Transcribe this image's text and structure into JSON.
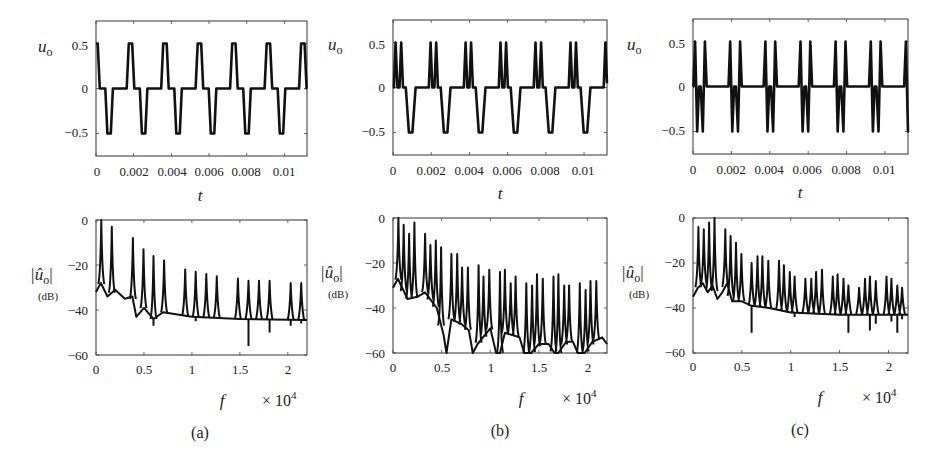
{
  "figure": {
    "panels": [
      {
        "id": "a",
        "caption": "(a)",
        "time_plot": {
          "ylabel": "u",
          "ylabel_sub": "o",
          "xlabel": "t",
          "xticks": [
            "0",
            "0.002",
            "0.004",
            "0.006",
            "0.008",
            "0.01"
          ],
          "yticks": [
            "0.5",
            "0",
            "−0.5"
          ]
        },
        "spectrum_plot": {
          "ylabel": "|û",
          "ylabel_sub": "o",
          "ylabel_close": "|",
          "ylabel_unit": "(dB)",
          "xlabel": "f",
          "xmult": "× 10",
          "xmult_exp": "4",
          "xticks": [
            "0",
            "0.5",
            "1",
            "1.5",
            "2"
          ],
          "yticks": [
            "0",
            "−20",
            "−40",
            "−60"
          ]
        }
      },
      {
        "id": "b",
        "caption": "(b)",
        "time_plot": {
          "ylabel": "u",
          "ylabel_sub": "o",
          "xlabel": "t",
          "xticks": [
            "0",
            "0.002",
            "0.004",
            "0.006",
            "0.008",
            "0.01"
          ],
          "yticks": [
            "0.5",
            "0",
            "−0.5"
          ]
        },
        "spectrum_plot": {
          "ylabel": "|û",
          "ylabel_sub": "o",
          "ylabel_close": "|",
          "ylabel_unit": "(dB)",
          "xlabel": "f",
          "xmult": "× 10",
          "xmult_exp": "4",
          "xticks": [
            "0",
            "0.5",
            "1",
            "1.5",
            "2"
          ],
          "yticks": [
            "0",
            "−20",
            "−40",
            "−60"
          ]
        }
      },
      {
        "id": "c",
        "caption": "(c)",
        "time_plot": {
          "ylabel": "u",
          "ylabel_sub": "o",
          "xlabel": "t",
          "xticks": [
            "0",
            "0.002",
            "0.004",
            "0.006",
            "0.008",
            "0.01"
          ],
          "yticks": [
            "0.5",
            "0",
            "−0.5"
          ]
        },
        "spectrum_plot": {
          "ylabel": "|û",
          "ylabel_sub": "o",
          "ylabel_close": "|",
          "ylabel_unit": "(dB)",
          "xlabel": "f",
          "xmult": "× 10",
          "xmult_exp": "4",
          "xticks": [
            "0",
            "0.5",
            "1",
            "1.5",
            "2"
          ],
          "yticks": [
            "0",
            "−20",
            "−40",
            "−60"
          ]
        }
      }
    ]
  },
  "chart_data": [
    {
      "panel": "a-top",
      "type": "line",
      "title": "",
      "xlabel": "t",
      "ylabel": "u_o",
      "xlim": [
        0,
        0.0112
      ],
      "ylim": [
        -0.75,
        0.75
      ],
      "xticks": [
        0,
        0.002,
        0.004,
        0.006,
        0.008,
        0.01
      ],
      "yticks": [
        0.5,
        0,
        -0.5
      ],
      "grid": false,
      "description": "Periodic multilevel waveform: one trapezoidal positive pulse (+0.5) and one negative pulse (-0.5) per period, period approx 0.00183 s, zero-level dwell between pulses",
      "period": 0.00183,
      "pattern": [
        {
          "t": 0.0,
          "v": 0
        },
        {
          "t": 0.06,
          "v": 0
        },
        {
          "t": 0.12,
          "v": 0.5
        },
        {
          "t": 0.22,
          "v": 0.5
        },
        {
          "t": 0.28,
          "v": 0
        },
        {
          "t": 0.44,
          "v": 0
        },
        {
          "t": 0.5,
          "v": -0.5
        },
        {
          "t": 0.6,
          "v": -0.5
        },
        {
          "t": 0.66,
          "v": 0
        },
        {
          "t": 1.0,
          "v": 0
        }
      ],
      "phase": -0.17
    },
    {
      "panel": "b-top",
      "type": "line",
      "title": "",
      "xlabel": "t",
      "ylabel": "u_o",
      "xlim": [
        0,
        0.0112
      ],
      "ylim": [
        -0.75,
        0.75
      ],
      "xticks": [
        0,
        0.002,
        0.004,
        0.006,
        0.008,
        0.01
      ],
      "yticks": [
        0.5,
        0,
        -0.5
      ],
      "grid": false,
      "description": "Periodic waveform: two narrow positive triangular pulses (+0.5) followed by one negative trapezoidal pulse (-0.5) per period, period approx 0.00183 s",
      "period": 0.00183,
      "pattern": [
        {
          "t": 0.0,
          "v": 0
        },
        {
          "t": 0.04,
          "v": 0
        },
        {
          "t": 0.09,
          "v": 0.5
        },
        {
          "t": 0.14,
          "v": 0
        },
        {
          "t": 0.2,
          "v": 0
        },
        {
          "t": 0.25,
          "v": 0.5
        },
        {
          "t": 0.3,
          "v": 0
        },
        {
          "t": 0.38,
          "v": 0
        },
        {
          "t": 0.47,
          "v": -0.5
        },
        {
          "t": 0.57,
          "v": -0.5
        },
        {
          "t": 0.66,
          "v": 0
        },
        {
          "t": 1.0,
          "v": 0
        }
      ],
      "phase": -0.015
    },
    {
      "panel": "c-top",
      "type": "line",
      "title": "",
      "xlabel": "t",
      "ylabel": "u_o",
      "xlim": [
        0,
        0.0112
      ],
      "ylim": [
        -0.75,
        0.75
      ],
      "xticks": [
        0,
        0.002,
        0.004,
        0.006,
        0.008,
        0.01
      ],
      "yticks": [
        0.5,
        0,
        -0.5
      ],
      "grid": false,
      "description": "Periodic waveform: two narrow positive triangular pulses (+0.5) and two narrow negative triangular pulses (-0.5) per period, period approx 0.00183 s",
      "period": 0.00183,
      "pattern": [
        {
          "t": 0.0,
          "v": 0
        },
        {
          "t": 0.04,
          "v": 0
        },
        {
          "t": 0.09,
          "v": 0.5
        },
        {
          "t": 0.15,
          "v": -0.5
        },
        {
          "t": 0.2,
          "v": 0
        },
        {
          "t": 0.25,
          "v": 0
        },
        {
          "t": 0.31,
          "v": -0.5
        },
        {
          "t": 0.37,
          "v": 0.5
        },
        {
          "t": 0.42,
          "v": 0
        },
        {
          "t": 1.0,
          "v": 0
        }
      ],
      "phase": -0.03
    },
    {
      "panel": "a-bottom",
      "type": "line",
      "title": "",
      "xlabel": "f (× 10^4)",
      "ylabel": "|û_o| (dB)",
      "xlim": [
        0,
        2.2
      ],
      "ylim": [
        -60,
        0
      ],
      "xticks": [
        0,
        0.5,
        1,
        1.5,
        2
      ],
      "yticks": [
        0,
        -20,
        -40,
        -60
      ],
      "grid": false,
      "floor": [
        {
          "f": 0.0,
          "db": -32
        },
        {
          "f": 0.05,
          "db": -28
        },
        {
          "f": 0.12,
          "db": -34
        },
        {
          "f": 0.2,
          "db": -31
        },
        {
          "f": 0.3,
          "db": -35
        },
        {
          "f": 0.38,
          "db": -34
        },
        {
          "f": 0.42,
          "db": -43
        },
        {
          "f": 0.5,
          "db": -39
        },
        {
          "f": 0.6,
          "db": -44
        },
        {
          "f": 0.7,
          "db": -41
        },
        {
          "f": 1.0,
          "db": -43
        },
        {
          "f": 1.5,
          "db": -44
        },
        {
          "f": 2.2,
          "db": -44.5
        }
      ],
      "peaks": [
        {
          "f": 0.055,
          "db": 0
        },
        {
          "f": 0.165,
          "db": -3
        },
        {
          "f": 0.385,
          "db": -8
        },
        {
          "f": 0.495,
          "db": -13
        },
        {
          "f": 0.6,
          "db": -16
        },
        {
          "f": 0.71,
          "db": -18
        },
        {
          "f": 0.93,
          "db": -22
        },
        {
          "f": 1.04,
          "db": -23
        },
        {
          "f": 1.15,
          "db": -24
        },
        {
          "f": 1.26,
          "db": -25
        },
        {
          "f": 1.48,
          "db": -26
        },
        {
          "f": 1.59,
          "db": -27
        },
        {
          "f": 1.7,
          "db": -27
        },
        {
          "f": 1.81,
          "db": -27
        },
        {
          "f": 2.03,
          "db": -28
        },
        {
          "f": 2.14,
          "db": -28
        }
      ],
      "dips": [
        {
          "f": 0.6,
          "db": -47
        },
        {
          "f": 1.04,
          "db": -45
        },
        {
          "f": 1.59,
          "db": -56
        },
        {
          "f": 1.81,
          "db": -50
        },
        {
          "f": 2.03,
          "db": -47
        },
        {
          "f": 2.14,
          "db": -46
        }
      ]
    },
    {
      "panel": "b-bottom",
      "type": "line",
      "title": "",
      "xlabel": "f (× 10^4)",
      "ylabel": "|û_o| (dB)",
      "xlim": [
        0,
        2.2
      ],
      "ylim": [
        -60,
        0
      ],
      "xticks": [
        0,
        0.5,
        1,
        1.5,
        2
      ],
      "yticks": [
        0,
        -20,
        -40,
        -60
      ],
      "grid": false,
      "floor": [
        {
          "f": 0.0,
          "db": -31
        },
        {
          "f": 0.05,
          "db": -27
        },
        {
          "f": 0.15,
          "db": -36
        },
        {
          "f": 0.25,
          "db": -35
        },
        {
          "f": 0.33,
          "db": -33
        },
        {
          "f": 0.45,
          "db": -40
        },
        {
          "f": 0.52,
          "db": -52
        },
        {
          "f": 0.55,
          "db": -60
        },
        {
          "f": 0.6,
          "db": -45
        },
        {
          "f": 0.7,
          "db": -47
        },
        {
          "f": 0.78,
          "db": -50
        },
        {
          "f": 0.82,
          "db": -60
        },
        {
          "f": 0.87,
          "db": -56
        },
        {
          "f": 1.0,
          "db": -49
        },
        {
          "f": 1.06,
          "db": -60
        },
        {
          "f": 1.1,
          "db": -60
        },
        {
          "f": 1.15,
          "db": -51
        },
        {
          "f": 1.3,
          "db": -53
        },
        {
          "f": 1.35,
          "db": -60
        },
        {
          "f": 1.42,
          "db": -60
        },
        {
          "f": 1.5,
          "db": -56
        },
        {
          "f": 1.6,
          "db": -56
        },
        {
          "f": 1.66,
          "db": -60
        },
        {
          "f": 1.7,
          "db": -60
        },
        {
          "f": 1.78,
          "db": -55
        },
        {
          "f": 1.85,
          "db": -55
        },
        {
          "f": 1.9,
          "db": -60
        },
        {
          "f": 1.97,
          "db": -60
        },
        {
          "f": 2.05,
          "db": -55
        },
        {
          "f": 2.15,
          "db": -53
        },
        {
          "f": 2.2,
          "db": -56
        }
      ],
      "peaks": [
        {
          "f": 0.055,
          "db": 0
        },
        {
          "f": 0.11,
          "db": -3
        },
        {
          "f": 0.165,
          "db": -7
        },
        {
          "f": 0.22,
          "db": -2
        },
        {
          "f": 0.33,
          "db": -7
        },
        {
          "f": 0.385,
          "db": -12
        },
        {
          "f": 0.44,
          "db": -10
        },
        {
          "f": 0.495,
          "db": -13
        },
        {
          "f": 0.6,
          "db": -16
        },
        {
          "f": 0.66,
          "db": -16
        },
        {
          "f": 0.71,
          "db": -22
        },
        {
          "f": 0.77,
          "db": -22
        },
        {
          "f": 0.88,
          "db": -21
        },
        {
          "f": 0.93,
          "db": -26
        },
        {
          "f": 0.99,
          "db": -23
        },
        {
          "f": 1.1,
          "db": -24
        },
        {
          "f": 1.15,
          "db": -23
        },
        {
          "f": 1.21,
          "db": -29
        },
        {
          "f": 1.26,
          "db": -26
        },
        {
          "f": 1.37,
          "db": -29
        },
        {
          "f": 1.43,
          "db": -30
        },
        {
          "f": 1.48,
          "db": -25
        },
        {
          "f": 1.54,
          "db": -27
        },
        {
          "f": 1.65,
          "db": -26
        },
        {
          "f": 1.7,
          "db": -25
        },
        {
          "f": 1.76,
          "db": -30
        },
        {
          "f": 1.81,
          "db": -30
        },
        {
          "f": 1.92,
          "db": -29
        },
        {
          "f": 1.98,
          "db": -32
        },
        {
          "f": 2.03,
          "db": -28
        },
        {
          "f": 2.09,
          "db": -28
        }
      ],
      "dips": []
    },
    {
      "panel": "c-bottom",
      "type": "line",
      "title": "",
      "xlabel": "f (× 10^4)",
      "ylabel": "|û_o| (dB)",
      "xlim": [
        0,
        2.2
      ],
      "ylim": [
        -60,
        0
      ],
      "xticks": [
        0,
        0.5,
        1,
        1.5,
        2
      ],
      "yticks": [
        0,
        -20,
        -40,
        -60
      ],
      "grid": false,
      "floor": [
        {
          "f": 0.0,
          "db": -35
        },
        {
          "f": 0.05,
          "db": -31
        },
        {
          "f": 0.1,
          "db": -29
        },
        {
          "f": 0.15,
          "db": -33
        },
        {
          "f": 0.2,
          "db": -30
        },
        {
          "f": 0.25,
          "db": -36
        },
        {
          "f": 0.3,
          "db": -33
        },
        {
          "f": 0.35,
          "db": -29
        },
        {
          "f": 0.4,
          "db": -37
        },
        {
          "f": 0.5,
          "db": -37
        },
        {
          "f": 0.6,
          "db": -39
        },
        {
          "f": 0.78,
          "db": -40
        },
        {
          "f": 1.0,
          "db": -42
        },
        {
          "f": 1.5,
          "db": -43
        },
        {
          "f": 2.2,
          "db": -43
        }
      ],
      "peaks": [
        {
          "f": 0.055,
          "db": -4
        },
        {
          "f": 0.11,
          "db": -5
        },
        {
          "f": 0.165,
          "db": -2
        },
        {
          "f": 0.22,
          "db": 0
        },
        {
          "f": 0.33,
          "db": -5
        },
        {
          "f": 0.385,
          "db": -8
        },
        {
          "f": 0.44,
          "db": -11
        },
        {
          "f": 0.495,
          "db": -16
        },
        {
          "f": 0.6,
          "db": -20
        },
        {
          "f": 0.66,
          "db": -17
        },
        {
          "f": 0.71,
          "db": -17
        },
        {
          "f": 0.77,
          "db": -19
        },
        {
          "f": 0.88,
          "db": -19
        },
        {
          "f": 0.93,
          "db": -21
        },
        {
          "f": 0.99,
          "db": -24
        },
        {
          "f": 1.04,
          "db": -26
        },
        {
          "f": 1.15,
          "db": -27
        },
        {
          "f": 1.21,
          "db": -27
        },
        {
          "f": 1.26,
          "db": -24
        },
        {
          "f": 1.32,
          "db": -23
        },
        {
          "f": 1.43,
          "db": -26
        },
        {
          "f": 1.48,
          "db": -25
        },
        {
          "f": 1.54,
          "db": -27
        },
        {
          "f": 1.59,
          "db": -30
        },
        {
          "f": 1.7,
          "db": -31
        },
        {
          "f": 1.76,
          "db": -27
        },
        {
          "f": 1.81,
          "db": -26
        },
        {
          "f": 1.87,
          "db": -28
        },
        {
          "f": 1.98,
          "db": -26
        },
        {
          "f": 2.03,
          "db": -27
        },
        {
          "f": 2.09,
          "db": -30
        },
        {
          "f": 2.14,
          "db": -31
        }
      ],
      "dips": [
        {
          "f": 0.6,
          "db": -51
        },
        {
          "f": 1.04,
          "db": -44
        },
        {
          "f": 1.59,
          "db": -51
        },
        {
          "f": 1.81,
          "db": -50
        },
        {
          "f": 1.87,
          "db": -47
        },
        {
          "f": 2.03,
          "db": -46
        },
        {
          "f": 2.09,
          "db": -51
        },
        {
          "f": 2.14,
          "db": -45
        }
      ]
    }
  ]
}
